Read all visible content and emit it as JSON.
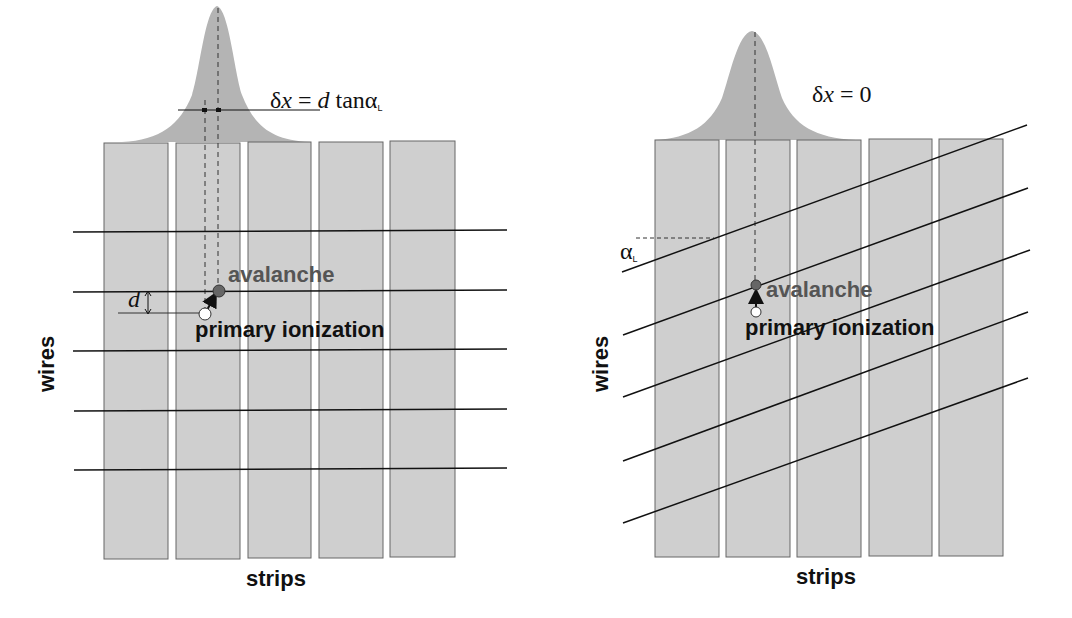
{
  "figure": {
    "left_panel": {
      "formula": {
        "delta": "δ",
        "x": "x",
        "eq": " = ",
        "d": "d",
        "tan": " tanα",
        "sub": "L"
      },
      "labels": {
        "avalanche": "avalanche",
        "primary_ionization": "primary ionization",
        "d": "d",
        "wires": "wires",
        "strips": "strips"
      },
      "strips_count": 5,
      "wires_count": 5,
      "wire_orientation": "horizontal"
    },
    "right_panel": {
      "formula": {
        "delta": "δ",
        "x": "x",
        "eq": " = 0"
      },
      "labels": {
        "avalanche": "avalanche",
        "primary_ionization": "primary ionization",
        "alpha": "α",
        "alpha_sub": "L",
        "wires": "wires",
        "strips": "strips"
      },
      "strips_count": 5,
      "wires_count": 5,
      "wire_orientation": "tilted by Lorentz angle"
    },
    "colors": {
      "strip_fill": "#cfcfcf",
      "strip_stroke": "#666666",
      "gaussian_fill": "#b4b4b4",
      "wire": "#111111",
      "avalanche_dot": "#666666",
      "ionization_dot": "#ffffff"
    }
  }
}
